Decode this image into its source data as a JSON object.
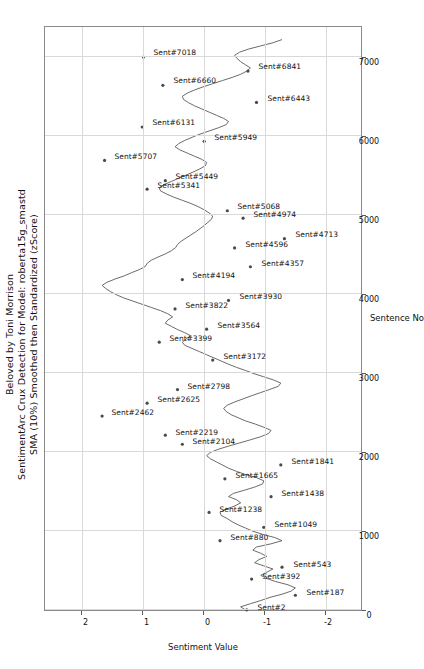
{
  "chart_data": {
    "type": "line",
    "title": "Beloved by Toni Morrison",
    "subtitle": "SentimentArc Crux Detection for Model: roberta15g_smastd",
    "subtitle2": "SMA (10%) Smoothed then Standardized (zScore)",
    "xlabel": "Sentence No",
    "ylabel": "Sentiment Value",
    "xlim": [
      0,
      7400
    ],
    "ylim": [
      -2.6,
      2.6
    ],
    "xticks": [
      0,
      1000,
      2000,
      3000,
      4000,
      5000,
      6000,
      7000
    ],
    "yticks": [
      -2,
      -1,
      0,
      1,
      2
    ],
    "grid": true,
    "line_color": "#5a5a5a",
    "legend": "none",
    "annotations": [
      {
        "label": "Sent#2",
        "x": 2,
        "y": -0.72
      },
      {
        "label": "Sent#187",
        "x": 187,
        "y": -1.52
      },
      {
        "label": "Sent#392",
        "x": 392,
        "y": -0.8
      },
      {
        "label": "Sent#543",
        "x": 543,
        "y": -1.3
      },
      {
        "label": "Sent#880",
        "x": 880,
        "y": -0.28
      },
      {
        "label": "Sent#1049",
        "x": 1049,
        "y": -1.0
      },
      {
        "label": "Sent#1238",
        "x": 1238,
        "y": -0.1
      },
      {
        "label": "Sent#1438",
        "x": 1438,
        "y": -1.12
      },
      {
        "label": "Sent#1665",
        "x": 1665,
        "y": -0.36
      },
      {
        "label": "Sent#1841",
        "x": 1841,
        "y": -1.28
      },
      {
        "label": "Sent#2104",
        "x": 2104,
        "y": 0.34
      },
      {
        "label": "Sent#2219",
        "x": 2219,
        "y": 0.62
      },
      {
        "label": "Sent#2462",
        "x": 2462,
        "y": 1.66
      },
      {
        "label": "Sent#2625",
        "x": 2625,
        "y": 0.92
      },
      {
        "label": "Sent#2798",
        "x": 2798,
        "y": 0.42
      },
      {
        "label": "Sent#3172",
        "x": 3172,
        "y": -0.16
      },
      {
        "label": "Sent#3399",
        "x": 3399,
        "y": 0.72
      },
      {
        "label": "Sent#3564",
        "x": 3564,
        "y": -0.06
      },
      {
        "label": "Sent#3822",
        "x": 3822,
        "y": 0.46
      },
      {
        "label": "Sent#3930",
        "x": 3930,
        "y": -0.42
      },
      {
        "label": "Sent#4194",
        "x": 4194,
        "y": 0.34
      },
      {
        "label": "Sent#4357",
        "x": 4357,
        "y": -0.78
      },
      {
        "label": "Sent#4596",
        "x": 4596,
        "y": -0.52
      },
      {
        "label": "Sent#4713",
        "x": 4713,
        "y": -1.34
      },
      {
        "label": "Sent#4974",
        "x": 4974,
        "y": -0.66
      },
      {
        "label": "Sent#5068",
        "x": 5068,
        "y": -0.4
      },
      {
        "label": "Sent#5341",
        "x": 5341,
        "y": 0.92
      },
      {
        "label": "Sent#5449",
        "x": 5449,
        "y": 0.62
      },
      {
        "label": "Sent#5707",
        "x": 5707,
        "y": 1.62
      },
      {
        "label": "Sent#5949",
        "x": 5949,
        "y": -0.02
      },
      {
        "label": "Sent#6131",
        "x": 6131,
        "y": 1.0
      },
      {
        "label": "Sent#6443",
        "x": 6443,
        "y": -0.88
      },
      {
        "label": "Sent#6660",
        "x": 6660,
        "y": 0.66
      },
      {
        "label": "Sent#6841",
        "x": 6841,
        "y": -0.74
      },
      {
        "label": "Sent#7018",
        "x": 7018,
        "y": 0.98
      }
    ],
    "x": [
      0,
      40,
      80,
      120,
      160,
      200,
      240,
      280,
      320,
      360,
      400,
      440,
      480,
      520,
      560,
      600,
      640,
      680,
      720,
      760,
      800,
      840,
      880,
      920,
      960,
      1000,
      1040,
      1080,
      1120,
      1160,
      1200,
      1240,
      1280,
      1320,
      1360,
      1400,
      1440,
      1480,
      1520,
      1560,
      1600,
      1640,
      1680,
      1720,
      1760,
      1800,
      1840,
      1880,
      1920,
      1960,
      2000,
      2040,
      2080,
      2120,
      2160,
      2200,
      2240,
      2280,
      2320,
      2360,
      2400,
      2440,
      2480,
      2520,
      2560,
      2600,
      2640,
      2680,
      2720,
      2760,
      2800,
      2840,
      2880,
      2920,
      2960,
      3000,
      3040,
      3080,
      3120,
      3160,
      3200,
      3240,
      3280,
      3320,
      3360,
      3400,
      3440,
      3480,
      3520,
      3560,
      3600,
      3640,
      3680,
      3720,
      3760,
      3800,
      3840,
      3880,
      3920,
      3960,
      4000,
      4040,
      4080,
      4120,
      4160,
      4200,
      4240,
      4280,
      4320,
      4360,
      4400,
      4440,
      4480,
      4520,
      4560,
      4600,
      4640,
      4680,
      4720,
      4760,
      4800,
      4840,
      4880,
      4920,
      4960,
      5000,
      5040,
      5080,
      5120,
      5160,
      5200,
      5240,
      5280,
      5320,
      5360,
      5400,
      5440,
      5480,
      5520,
      5560,
      5600,
      5640,
      5680,
      5720,
      5760,
      5800,
      5840,
      5880,
      5920,
      5960,
      6000,
      6040,
      6080,
      6120,
      6160,
      6200,
      6240,
      6280,
      6320,
      6360,
      6400,
      6440,
      6480,
      6520,
      6560,
      6600,
      6640,
      6680,
      6720,
      6760,
      6800,
      6840,
      6880,
      6920,
      6960,
      7000,
      7040,
      7080,
      7120,
      7160,
      7200,
      7240
    ],
    "y": [
      -0.7,
      -0.62,
      -0.78,
      -0.95,
      -1.1,
      -1.3,
      -1.45,
      -1.52,
      -1.4,
      -1.2,
      -1.05,
      -0.95,
      -1.05,
      -1.15,
      -1.0,
      -0.85,
      -0.92,
      -1.05,
      -0.95,
      -0.82,
      -0.88,
      -1.12,
      -1.3,
      -1.18,
      -0.98,
      -0.82,
      -0.7,
      -0.58,
      -0.48,
      -0.4,
      -0.3,
      -0.28,
      -0.38,
      -0.52,
      -0.62,
      -0.55,
      -0.42,
      -0.5,
      -0.68,
      -0.85,
      -0.98,
      -1.0,
      -0.88,
      -0.7,
      -0.55,
      -0.42,
      -0.32,
      -0.22,
      -0.12,
      -0.06,
      -0.12,
      -0.25,
      -0.42,
      -0.6,
      -0.78,
      -0.95,
      -1.08,
      -1.12,
      -1.0,
      -0.86,
      -0.7,
      -0.58,
      -0.46,
      -0.38,
      -0.34,
      -0.4,
      -0.52,
      -0.66,
      -0.8,
      -0.95,
      -1.1,
      -1.24,
      -1.28,
      -1.16,
      -1.0,
      -0.84,
      -0.7,
      -0.55,
      -0.42,
      -0.3,
      -0.18,
      -0.06,
      0.06,
      0.18,
      0.3,
      0.34,
      0.28,
      0.2,
      0.3,
      0.42,
      0.52,
      0.62,
      0.58,
      0.5,
      0.58,
      0.7,
      0.85,
      1.0,
      1.15,
      1.3,
      1.42,
      1.52,
      1.6,
      1.66,
      1.58,
      1.45,
      1.3,
      1.18,
      1.05,
      0.95,
      0.92,
      0.85,
      0.74,
      0.62,
      0.52,
      0.45,
      0.42,
      0.36,
      0.28,
      0.2,
      0.12,
      0.05,
      -0.02,
      -0.08,
      -0.14,
      -0.16,
      -0.1,
      -0.02,
      0.08,
      0.2,
      0.34,
      0.48,
      0.6,
      0.7,
      0.72,
      0.64,
      0.52,
      0.4,
      0.28,
      0.16,
      0.05,
      -0.04,
      -0.06,
      0.02,
      0.14,
      0.26,
      0.38,
      0.46,
      0.4,
      0.3,
      0.18,
      0.05,
      -0.1,
      -0.25,
      -0.38,
      -0.42,
      -0.34,
      -0.22,
      -0.1,
      0.02,
      0.14,
      0.24,
      0.32,
      0.34,
      0.26,
      0.14,
      0.0,
      -0.16,
      -0.32,
      -0.48,
      -0.62,
      -0.72,
      -0.78,
      -0.7,
      -0.62,
      -0.56,
      -0.52,
      -0.6,
      -0.75,
      -0.95,
      -1.15,
      -1.3,
      -1.34,
      -1.22,
      -1.05,
      -0.9,
      -0.78,
      -0.7,
      -0.66,
      -0.58,
      -0.48,
      -0.4
    ]
  }
}
